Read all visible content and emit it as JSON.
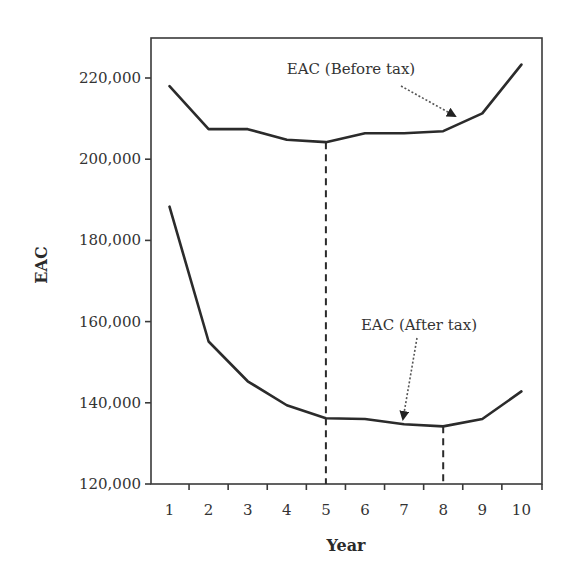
{
  "chart_data": {
    "type": "line",
    "title": "",
    "xlabel": "Year",
    "ylabel": "EAC",
    "x": [
      1,
      2,
      3,
      4,
      5,
      6,
      7,
      8,
      9,
      10
    ],
    "x_tick_labels": [
      "1",
      "2",
      "3",
      "4",
      "5",
      "6",
      "7",
      "8",
      "9",
      "10"
    ],
    "y_tick_labels": [
      "220,000",
      "200,000",
      "180,000",
      "160,000",
      "140,000",
      "120,000"
    ],
    "y_ticks": [
      220000,
      200000,
      180000,
      160000,
      140000,
      120000
    ],
    "ylim": [
      120000,
      229000
    ],
    "xlim": [
      0.5,
      10.5
    ],
    "grid": false,
    "legend": "none (inline annotations)",
    "series": [
      {
        "name": "EAC (Before tax)",
        "values": [
          218000,
          207400,
          207400,
          204800,
          204200,
          206400,
          206400,
          206900,
          211300,
          223300
        ]
      },
      {
        "name": "EAC (After tax)",
        "values": [
          188300,
          155100,
          145300,
          139400,
          136200,
          136000,
          134700,
          134200,
          136000,
          142800
        ]
      }
    ],
    "annotations": [
      {
        "text": "EAC (Before tax)",
        "arrow_to": {
          "x": 8.5,
          "series": "EAC (Before tax)"
        }
      },
      {
        "text": "EAC (After tax)",
        "arrow_to": {
          "x": 6.9,
          "series": "EAC (After tax)"
        }
      }
    ],
    "reference_lines": [
      {
        "type": "vertical-dashed",
        "x": 5,
        "from_series": "EAC (Before tax)",
        "note": "minimum before-tax EAC"
      },
      {
        "type": "vertical-dashed",
        "x": 8,
        "from_series": "EAC (After tax)",
        "note": "minimum after-tax EAC"
      }
    ]
  },
  "labels": {
    "xlabel": "Year",
    "ylabel": "EAC",
    "before_tax": "EAC (Before tax)",
    "after_tax": "EAC (After tax)"
  }
}
